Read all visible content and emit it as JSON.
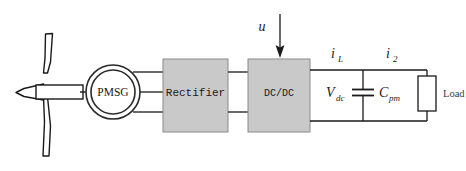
{
  "diagram": {
    "background_color": "#ffffff",
    "line_color": "#1a1a1a",
    "block_fill": "#c9c9c9",
    "block_stroke": "#8a8a8a"
  },
  "turbine": {
    "name": "wind-turbine",
    "blades": 3,
    "hub_label": ""
  },
  "generator": {
    "label": "PMSG",
    "phases": 3
  },
  "blocks": [
    {
      "id": "rectifier",
      "label": "Rectifier"
    },
    {
      "id": "dcdc",
      "label": "DC/DC"
    }
  ],
  "control": {
    "label": "u",
    "arrow": "down-arrow-icon",
    "target": "dcdc"
  },
  "signals": {
    "current_inductor": {
      "symbol": "i",
      "subscript": "L"
    },
    "current_output": {
      "symbol": "i",
      "subscript": "2"
    }
  },
  "dc_bus": {
    "voltage": {
      "symbol": "V",
      "subscript": "dc"
    },
    "capacitor": {
      "symbol": "C",
      "subscript": "pm"
    }
  },
  "load": {
    "label": "Load"
  }
}
